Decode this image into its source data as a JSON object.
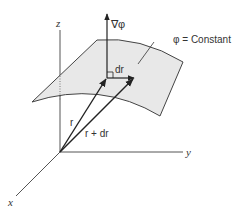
{
  "figure": {
    "axes": {
      "x_label": "x",
      "y_label": "y",
      "z_label": "z"
    },
    "vectors": {
      "gradient_label": "∇φ",
      "r_label": "r",
      "r_plus_dr_label": "r + dr",
      "dr_label": "dr"
    },
    "surface": {
      "label": "φ = Constant",
      "fill_color": "#e8e8e8",
      "edge_color": "#444444"
    },
    "colors": {
      "line": "#333333",
      "axis": "#555555"
    }
  }
}
